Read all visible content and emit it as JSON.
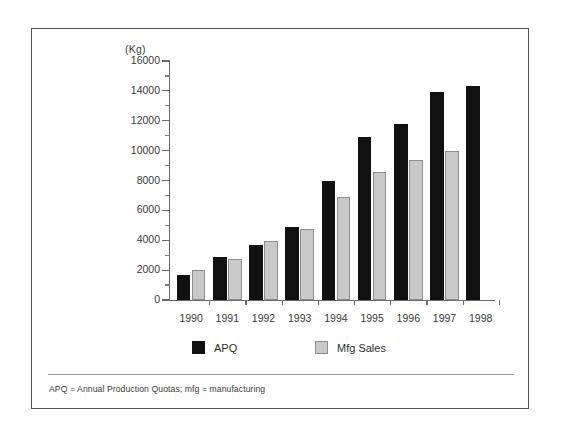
{
  "chart_data": {
    "type": "bar",
    "title": "",
    "xlabel": "",
    "ylabel": "(Kg)",
    "unit_label": "(Kg)",
    "ylim": [
      0,
      16000
    ],
    "y_major_step": 2000,
    "y_minor_step": 1000,
    "grid": false,
    "legend_position": "bottom",
    "categories": [
      "1990",
      "1991",
      "1992",
      "1993",
      "1994",
      "1995",
      "1996",
      "1997",
      "1998"
    ],
    "y_tick_labels": [
      "0",
      "2000",
      "4000",
      "6000",
      "8000",
      "10000",
      "12000",
      "14000",
      "16000"
    ],
    "series": [
      {
        "name": "APQ",
        "color": "#111111",
        "values": [
          1700,
          2900,
          3700,
          4900,
          8000,
          10900,
          11800,
          13900,
          14300
        ]
      },
      {
        "name": "Mfg Sales",
        "color": "#c9c9c9",
        "values": [
          2000,
          2750,
          3950,
          4750,
          6900,
          8600,
          9400,
          9950,
          null
        ]
      }
    ],
    "footnote": "APQ = Annual Production Quotas; mfg = manufacturing"
  },
  "legend": {
    "items": [
      {
        "label": "APQ",
        "swatch": "black-square-swatch"
      },
      {
        "label": "Mfg Sales",
        "swatch": "gray-square-swatch"
      }
    ]
  }
}
